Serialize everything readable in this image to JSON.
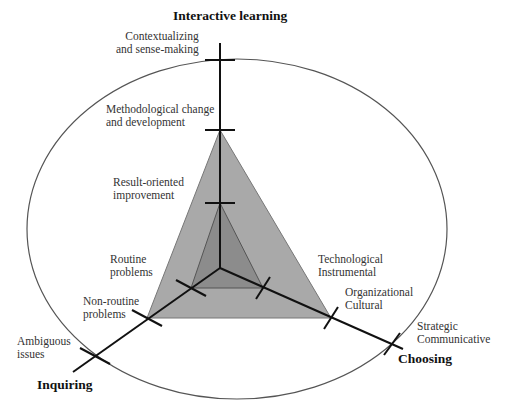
{
  "axes": {
    "interactive": {
      "title": "Interactive learning"
    },
    "inquiring": {
      "title": "Inquiring"
    },
    "choosing": {
      "title": "Choosing"
    }
  },
  "levels": {
    "interactive": [
      {
        "label": "Result-oriented\nimprovement"
      },
      {
        "label": "Methodological change\nand development"
      },
      {
        "label": "Contextualizing\nand sense-making"
      }
    ],
    "inquiring": [
      {
        "label": "Routine\nproblems"
      },
      {
        "label": "Non-routine\nproblems"
      },
      {
        "label": "Ambiguous\nissues"
      }
    ],
    "choosing": [
      {
        "label": "Technological\nInstrumental"
      },
      {
        "label": "Organizational\nCultural"
      },
      {
        "label": "Strategic\nCommunicative"
      }
    ]
  },
  "colors": {
    "outer_triangle_fill": "#a9a9a9",
    "inner_triangle_fill": "#8c8c8c",
    "axis_stroke": "#111111",
    "ellipse_stroke": "#555555"
  }
}
